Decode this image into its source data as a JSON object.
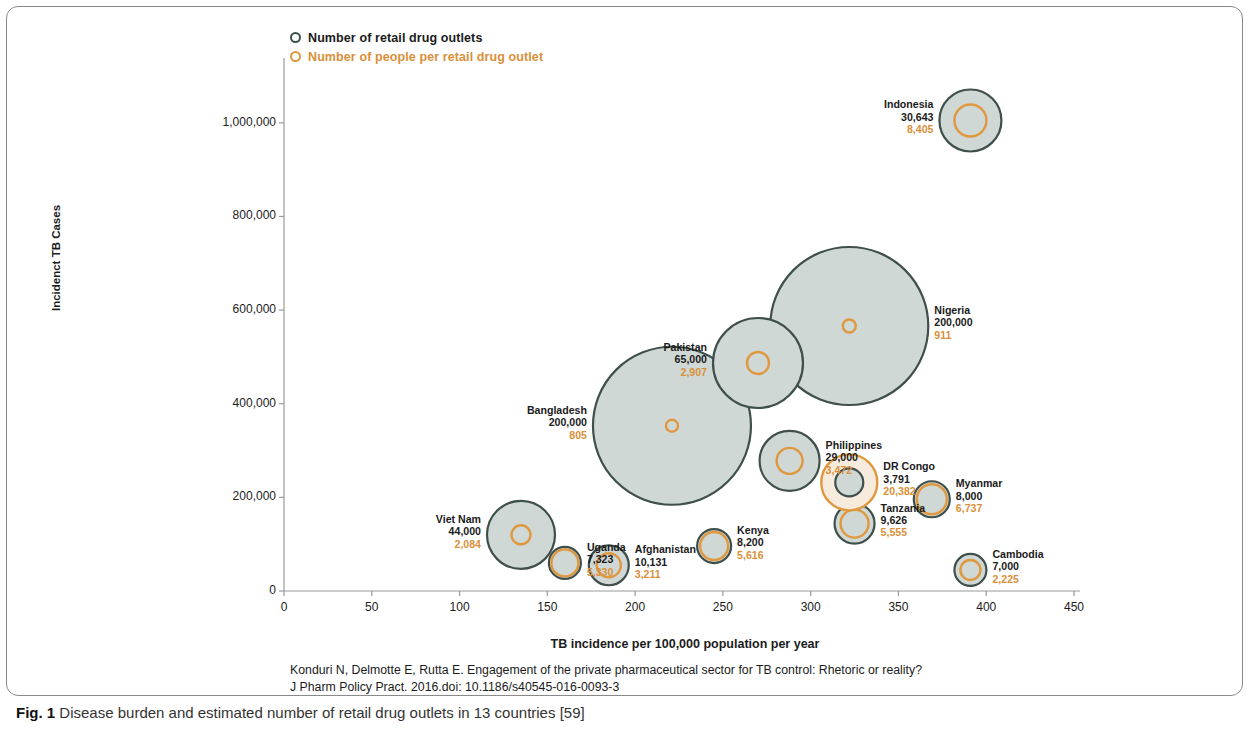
{
  "caption": {
    "prefix": "Fig. 1",
    "text": "Disease burden and estimated number of retail drug outlets in 13 countries [59]"
  },
  "citation": {
    "line1": "Konduri N, Delmotte E, Rutta E. Engagement of the private pharmaceutical sector for TB control: Rhetoric or reality?",
    "line2": "J Pharm Policy Pract. 2016.doi: 10.1186/s40545-016-0093-3"
  },
  "colors": {
    "gray_fill": "#cfd8d5",
    "gray_stroke": "#3f4f4b",
    "orange_stroke": "#e0983f",
    "orange_fill": "#f6ebdc",
    "axis": "#9a9a9a",
    "text": "#1b1b1b",
    "orange_text": "#d9903a"
  },
  "chart_data": {
    "type": "scatter",
    "title": "",
    "xlabel": "TB incidence per 100,000 population per year",
    "ylabel": "Incidenct TB Cases",
    "xlim": [
      0,
      450
    ],
    "ylim": [
      0,
      1100000
    ],
    "xticks": [
      "0",
      "50",
      "100",
      "150",
      "200",
      "250",
      "300",
      "350",
      "400",
      "450"
    ],
    "yticks": [
      "0",
      "200,000",
      "400,000",
      "600,000",
      "800,000",
      "1,000,000"
    ],
    "grid": false,
    "legend_position": "top-left",
    "legend": [
      {
        "key": "outlets",
        "label": "Number of retail drug outlets",
        "color": "#3f4f4b"
      },
      {
        "key": "people_per_outlet",
        "label": "Number of people per retail drug outlet",
        "color": "#d9903a"
      }
    ],
    "size_encoding": {
      "gray_circle": "Number of retail drug outlets",
      "orange_circle": "Number of people per retail drug outlet"
    },
    "points": [
      {
        "name": "Indonesia",
        "x": 391,
        "y": 1005000,
        "outlets": "30,643",
        "people_per_outlet": "8,405",
        "outlets_value": 30643,
        "ppo_value": 8405,
        "r_gray": 31,
        "r_orange": 16,
        "label_side": "left"
      },
      {
        "name": "Nigeria",
        "x": 322,
        "y": 566000,
        "outlets": "200,000",
        "people_per_outlet": "911",
        "outlets_value": 200000,
        "ppo_value": 911,
        "r_gray": 79,
        "r_orange": 6.5,
        "label_side": "right"
      },
      {
        "name": "Pakistan",
        "x": 270,
        "y": 487000,
        "outlets": "65,000",
        "people_per_outlet": "2,907",
        "outlets_value": 65000,
        "ppo_value": 2907,
        "r_gray": 45,
        "r_orange": 11,
        "label_side": "left"
      },
      {
        "name": "Bangladesh",
        "x": 221,
        "y": 353000,
        "outlets": "200,000",
        "people_per_outlet": "805",
        "outlets_value": 200000,
        "ppo_value": 805,
        "r_gray": 79,
        "r_orange": 6,
        "label_side": "left"
      },
      {
        "name": "Philippines",
        "x": 288,
        "y": 278000,
        "outlets": "29,000",
        "people_per_outlet": "3,472",
        "outlets_value": 29000,
        "ppo_value": 3472,
        "r_gray": 30,
        "r_orange": 13,
        "label_side": "right"
      },
      {
        "name": "DR Congo",
        "x": 322,
        "y": 232000,
        "outlets": "3,791",
        "people_per_outlet": "20,382",
        "outlets_value": 3791,
        "ppo_value": 20382,
        "r_gray": 14,
        "r_orange": 28,
        "label_side": "right"
      },
      {
        "name": "Myanmar",
        "x": 369,
        "y": 196000,
        "outlets": "8,000",
        "people_per_outlet": "6,737",
        "outlets_value": 8000,
        "ppo_value": 6737,
        "r_gray": 18,
        "r_orange": 15,
        "label_side": "right"
      },
      {
        "name": "Tanzania",
        "x": 325,
        "y": 144000,
        "outlets": "9,626",
        "people_per_outlet": "5,555",
        "outlets_value": 9626,
        "ppo_value": 5555,
        "r_gray": 20,
        "r_orange": 14,
        "label_side": "right"
      },
      {
        "name": "Viet Nam",
        "x": 135,
        "y": 120000,
        "outlets": "44,000",
        "people_per_outlet": "2,084",
        "outlets_value": 44000,
        "ppo_value": 2084,
        "r_gray": 34,
        "r_orange": 9.5,
        "label_side": "left"
      },
      {
        "name": "Kenya",
        "x": 245,
        "y": 96000,
        "outlets": "8,200",
        "people_per_outlet": "5,616",
        "outlets_value": 8200,
        "ppo_value": 5616,
        "r_gray": 17,
        "r_orange": 14,
        "label_side": "right"
      },
      {
        "name": "Uganda",
        "x": 160,
        "y": 60000,
        "outlets": "7,323",
        "people_per_outlet": "5,330",
        "outlets_value": 7323,
        "ppo_value": 5330,
        "r_gray": 16,
        "r_orange": 13.5,
        "label_side": "right"
      },
      {
        "name": "Afghanistan",
        "x": 185,
        "y": 55000,
        "outlets": "10,131",
        "people_per_outlet": "3,211",
        "outlets_value": 10131,
        "ppo_value": 3211,
        "r_gray": 20,
        "r_orange": 12,
        "label_side": "right"
      },
      {
        "name": "Cambodia",
        "x": 391,
        "y": 45000,
        "outlets": "7,000",
        "people_per_outlet": "2,225",
        "outlets_value": 7000,
        "ppo_value": 2225,
        "r_gray": 16,
        "r_orange": 10,
        "label_side": "right"
      }
    ]
  }
}
